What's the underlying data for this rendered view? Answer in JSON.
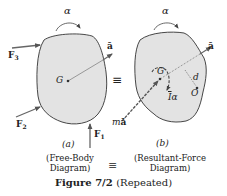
{
  "figure": {
    "title": "Figure 7/2",
    "title_suffix": "(Repeated)",
    "equivalence_symbol": "≡",
    "colors": {
      "body_fill": "#e3e3e3",
      "outline": "#333333",
      "arrow": "#666666",
      "text": "#222222"
    }
  },
  "panel_a": {
    "tag": "(a)",
    "caption_line1": "(Free-Body",
    "caption_line2": "Diagram)",
    "labels": {
      "alpha": "α",
      "accel": "ā",
      "center": "G",
      "force1": "F",
      "force1_sub": "1",
      "force2": "F",
      "force2_sub": "2",
      "force3": "F",
      "force3_sub": "3"
    }
  },
  "panel_b": {
    "tag": "(b)",
    "caption_line1": "(Resultant-Force",
    "caption_line2": "Diagram)",
    "labels": {
      "alpha": "α",
      "accel": "ā",
      "center": "G",
      "distance": "d",
      "point": "O",
      "moment": "Iα",
      "moment_bar": "I",
      "moment_alpha": "α",
      "resultant_force": "mā",
      "resultant_m": "m",
      "resultant_a": "ā"
    }
  }
}
